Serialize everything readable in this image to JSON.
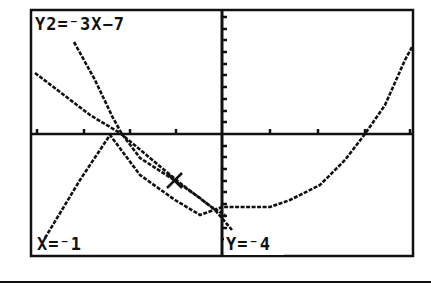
{
  "calculator": {
    "equation_label": "Y2=⁻3X−7",
    "cursor_x_label": "X=⁻1",
    "cursor_y_label": "Y=⁻4"
  },
  "colors": {
    "ink": "#111111",
    "background": "#ffffff"
  },
  "chart_data": {
    "type": "line",
    "title": "",
    "xlabel": "",
    "ylabel": "",
    "grid": false,
    "axes": {
      "x_ticks": 9,
      "y_ticks_spacing_units": 1
    },
    "series": [
      {
        "name": "Y1 (parabola)",
        "equation": "",
        "points_px": [
          [
            45,
            238
          ],
          [
            80,
            180
          ],
          [
            110,
            135
          ],
          [
            140,
            175
          ],
          [
            175,
            200
          ],
          [
            200,
            215
          ],
          [
            222,
            207
          ],
          [
            270,
            207
          ],
          [
            290,
            200
          ],
          [
            320,
            185
          ],
          [
            345,
            160
          ],
          [
            365,
            134
          ],
          [
            385,
            105
          ],
          [
            405,
            60
          ],
          [
            412,
            47
          ]
        ]
      },
      {
        "name": "Y2 (trace line)",
        "equation": "Y2=-3X-7",
        "points_px": [
          [
            74,
            42
          ],
          [
            95,
            80
          ],
          [
            113,
            118
          ],
          [
            122,
            134
          ],
          [
            140,
            158
          ],
          [
            174,
            180
          ],
          [
            200,
            198
          ],
          [
            215,
            210
          ],
          [
            232,
            230
          ]
        ]
      },
      {
        "name": "Y3 (line)",
        "equation": "",
        "points_px": [
          [
            35,
            73
          ],
          [
            60,
            92
          ],
          [
            90,
            115
          ],
          [
            120,
            133
          ],
          [
            150,
            158
          ],
          [
            180,
            183
          ],
          [
            210,
            206
          ],
          [
            225,
            215
          ]
        ]
      }
    ],
    "cursor": {
      "x": -1,
      "y": -4,
      "marker": "cross"
    }
  }
}
